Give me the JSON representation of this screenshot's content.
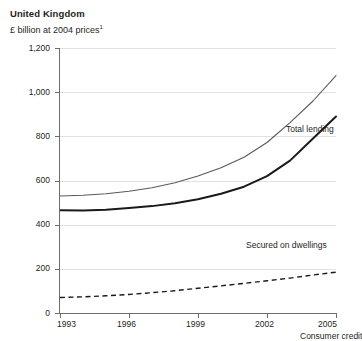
{
  "header": {
    "title": "United Kingdom",
    "subtitle_text": "£ billion at 2004 prices",
    "subtitle_footnote": "1"
  },
  "colors": {
    "total_lending": "#595959",
    "secured_on_dwellings": "#1a1a1a",
    "consumer_credit": "#1a1a1a",
    "gridline": "#e2e2e2",
    "axis": "#6d6d6d",
    "text": "#231f20",
    "background": "#ffffff"
  },
  "labels": {
    "total_lending": "Total lending",
    "secured_on_dwellings": "Secured on dwellings",
    "consumer_credit": "Consumer credit"
  },
  "axes": {
    "y_ticks": [
      "1,200",
      "1,000",
      "800",
      "600",
      "400",
      "200",
      "0"
    ],
    "x_ticks": [
      "1993",
      "1996",
      "1999",
      "2002",
      "2005"
    ]
  },
  "chart_data": {
    "type": "line",
    "title": "United Kingdom",
    "subtitle": "£ billion at 2004 prices¹",
    "xlabel": "",
    "ylabel": "£ billion at 2004 prices",
    "xlim": [
      1993,
      2005
    ],
    "ylim": [
      0,
      1200
    ],
    "y_tick_values": [
      0,
      200,
      400,
      600,
      800,
      1000,
      1200
    ],
    "x_tick_values": [
      1993,
      1996,
      1999,
      2002,
      2005
    ],
    "grid": "horizontal",
    "legend": "inline-annotations",
    "x": [
      1993,
      1994,
      1995,
      1996,
      1997,
      1998,
      1999,
      2000,
      2001,
      2002,
      2003,
      2004,
      2005
    ],
    "series": [
      {
        "name": "Total lending",
        "style": "solid-thin",
        "color": "#595959",
        "values": [
          530,
          533,
          540,
          551,
          567,
          590,
          620,
          658,
          705,
          772,
          862,
          960,
          1075
        ]
      },
      {
        "name": "Secured on dwellings",
        "style": "solid-thick",
        "color": "#1a1a1a",
        "values": [
          465,
          464,
          468,
          475,
          484,
          497,
          515,
          540,
          572,
          620,
          690,
          790,
          890
        ]
      },
      {
        "name": "Consumer credit",
        "style": "dashed",
        "color": "#1a1a1a",
        "values": [
          70,
          73,
          78,
          84,
          92,
          101,
          112,
          123,
          134,
          146,
          158,
          172,
          185
        ]
      }
    ]
  }
}
